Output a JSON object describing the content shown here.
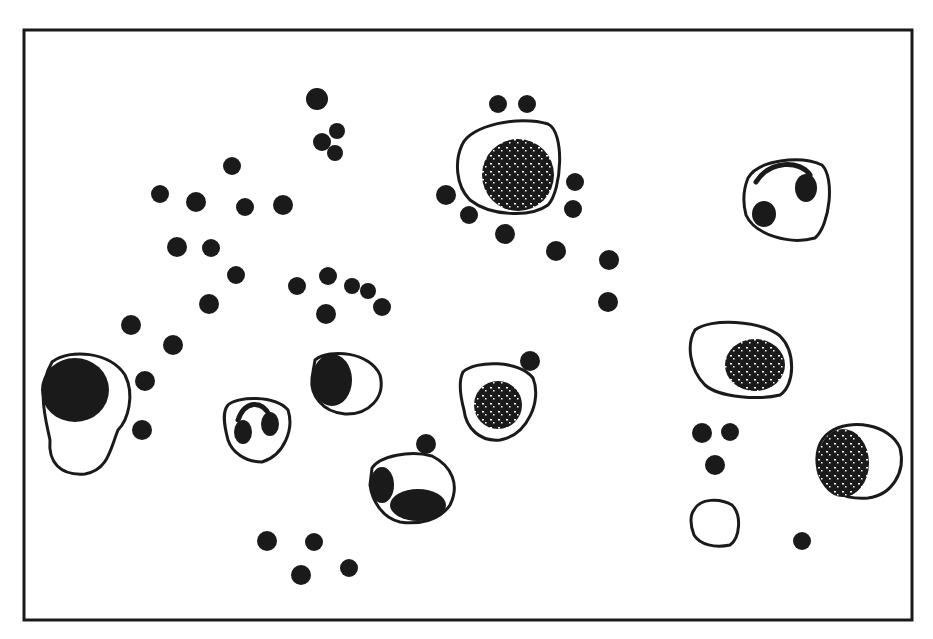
{
  "figure": {
    "kind": "pen-and-ink blood smear illustration",
    "background": "#ffffff",
    "ink": "#1a1a1a",
    "frame": {
      "x": 24,
      "y": 30,
      "w": 888,
      "h": 590,
      "stroke_width": 3
    },
    "dots": [
      [
        317,
        99,
        11
      ],
      [
        337,
        131,
        8
      ],
      [
        322,
        142,
        9
      ],
      [
        335,
        153,
        8
      ],
      [
        232,
        166,
        9
      ],
      [
        160,
        194,
        9
      ],
      [
        196,
        202,
        10
      ],
      [
        245,
        207,
        9
      ],
      [
        283,
        205,
        10
      ],
      [
        177,
        247,
        10
      ],
      [
        211,
        248,
        9
      ],
      [
        236,
        275,
        9
      ],
      [
        297,
        286,
        9
      ],
      [
        328,
        276,
        9
      ],
      [
        352,
        286,
        8
      ],
      [
        368,
        291,
        8
      ],
      [
        382,
        307,
        9
      ],
      [
        326,
        314,
        10
      ],
      [
        209,
        304,
        10
      ],
      [
        131,
        325,
        10
      ],
      [
        173,
        345,
        10
      ],
      [
        145,
        381,
        10
      ],
      [
        142,
        430,
        10
      ],
      [
        498,
        104,
        9
      ],
      [
        527,
        104,
        9
      ],
      [
        446,
        195,
        10
      ],
      [
        469,
        215,
        9
      ],
      [
        575,
        182,
        9
      ],
      [
        573,
        209,
        9
      ],
      [
        505,
        234,
        10
      ],
      [
        556,
        251,
        10
      ],
      [
        609,
        260,
        10
      ],
      [
        608,
        302,
        10
      ],
      [
        530,
        361,
        10
      ],
      [
        426,
        444,
        10
      ],
      [
        267,
        541,
        10
      ],
      [
        314,
        542,
        9
      ],
      [
        301,
        575,
        10
      ],
      [
        349,
        568,
        9
      ],
      [
        702,
        433,
        10
      ],
      [
        730,
        432,
        9
      ],
      [
        715,
        465,
        10
      ],
      [
        802,
        541,
        9
      ]
    ],
    "cells": [
      {
        "name": "large-cell-top-center",
        "outline": "M462,145 C470,125 520,115 548,124 C565,132 562,190 548,205 C530,218 490,216 470,200 C455,185 455,160 462,145 Z",
        "nucleus": {
          "cx": 518,
          "cy": 175,
          "rx": 36,
          "ry": 36,
          "speckled": true
        }
      },
      {
        "name": "ring-cell-top-right",
        "outline": "M748,178 C758,160 800,155 822,165 C835,178 830,225 815,238 C790,245 755,235 746,215 C742,200 744,188 748,178 Z",
        "lobes": [
          [
            806,
            188,
            11,
            14
          ],
          [
            764,
            214,
            12,
            13
          ]
        ],
        "arc": "M756,182 C770,160 800,160 810,175"
      },
      {
        "name": "large-cell-left",
        "outline": "M52,362 C70,348 110,352 125,375 C135,395 128,420 118,430 C110,450 108,470 85,474 C60,476 48,462 50,440 C46,420 36,390 52,362 Z",
        "nucleus": {
          "cx": 75,
          "cy": 390,
          "rx": 34,
          "ry": 32,
          "speckled": false
        }
      },
      {
        "name": "bilobed-cell",
        "outline": "M228,405 C238,396 275,395 288,410 C294,428 285,455 262,462 C245,462 232,452 228,440 C224,425 222,412 228,405 Z",
        "lobes": [
          [
            243,
            432,
            9,
            12
          ],
          [
            270,
            424,
            9,
            12
          ]
        ],
        "arc": "M238,420 C245,400 262,400 270,416"
      },
      {
        "name": "crescent-cell-center",
        "outline": "M315,360 C330,348 370,352 380,375 C386,398 368,415 345,414 C322,412 310,395 312,378 Z",
        "nucleus": {
          "cx": 332,
          "cy": 380,
          "rx": 20,
          "ry": 26,
          "speckled": false
        }
      },
      {
        "name": "cell-center-right",
        "outline": "M463,372 C475,360 520,360 533,378 C542,400 528,435 500,440 C480,442 466,428 464,410 C460,395 458,382 463,372 Z",
        "nucleus": {
          "cx": 498,
          "cy": 405,
          "rx": 24,
          "ry": 24,
          "speckled": true
        }
      },
      {
        "name": "irregular-cell-bottom-center",
        "outline": "M372,468 C380,456 410,450 432,456 C452,466 460,485 450,505 C440,520 420,525 400,522 C382,518 372,500 370,485 Z",
        "nucleus": {
          "cx": 418,
          "cy": 505,
          "rx": 28,
          "ry": 16,
          "speckled": false
        },
        "patch": {
          "cx": 382,
          "cy": 485,
          "rx": 12,
          "ry": 18
        }
      },
      {
        "name": "oval-cell-right",
        "outline": "M695,330 C710,318 760,320 780,336 C796,352 795,385 780,395 C760,400 720,398 705,385 C690,370 686,345 695,330 Z",
        "nucleus": {
          "cx": 755,
          "cy": 365,
          "rx": 30,
          "ry": 26,
          "speckled": true
        }
      },
      {
        "name": "round-cell-bottom-right",
        "outline": "M830,432 C850,418 890,424 900,448 C906,472 892,495 868,498 C845,500 822,490 818,470 C815,455 818,440 830,432 Z",
        "nucleus": {
          "cx": 843,
          "cy": 463,
          "rx": 26,
          "ry": 34,
          "speckled": true
        }
      },
      {
        "name": "platelet-bottom-right",
        "outline": "M694,510 C700,498 720,498 732,505 C742,515 740,538 730,545 C715,548 700,545 694,535 C690,525 690,515 694,510 Z"
      }
    ]
  }
}
